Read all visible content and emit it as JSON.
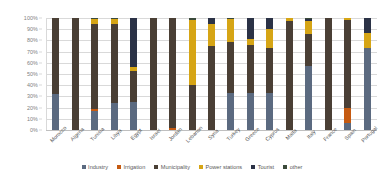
{
  "chart_data": {
    "type": "bar",
    "subtype": "stacked-percent",
    "title": "",
    "xlabel": "",
    "ylabel": "",
    "ylim": [
      0,
      100
    ],
    "ytick_labels": [
      "0%",
      "10%",
      "20%",
      "30%",
      "40%",
      "50%",
      "60%",
      "70%",
      "80%",
      "90%",
      "100%"
    ],
    "ytick_values": [
      0,
      10,
      20,
      30,
      40,
      50,
      60,
      70,
      80,
      90,
      100
    ],
    "grid": true,
    "legend_position": "bottom",
    "categories": [
      "Morocco",
      "Algeria",
      "Tunisia",
      "Libya",
      "Egypt",
      "Israel",
      "Jordan",
      "Lebanon",
      "Syria",
      "Turkey",
      "Greece",
      "Cyprus",
      "Malta",
      "Italy",
      "France",
      "Spain",
      "Portugal"
    ],
    "series": [
      {
        "name": "Industry",
        "color": "#5b6a80",
        "values": [
          32,
          0,
          17,
          24,
          25,
          0,
          0,
          0,
          0,
          33,
          33,
          33,
          0,
          57,
          0,
          6,
          73
        ]
      },
      {
        "name": "Irrigation",
        "color": "#c55a11",
        "values": [
          0,
          0,
          2,
          0,
          0,
          0,
          2,
          0,
          0,
          0,
          0,
          0,
          0,
          0,
          0,
          14,
          0
        ]
      },
      {
        "name": "Municipality",
        "color": "#4a3f35",
        "values": [
          68,
          100,
          76,
          71,
          28,
          100,
          98,
          40,
          75,
          46,
          43,
          40,
          97,
          29,
          100,
          78,
          0
        ]
      },
      {
        "name": "Power stations",
        "color": "#d6a515",
        "values": [
          0,
          0,
          4,
          4,
          3,
          0,
          0,
          58,
          20,
          20,
          5,
          17,
          3,
          11,
          0,
          2,
          14
        ]
      },
      {
        "name": "Tourist",
        "color": "#2b3246",
        "values": [
          0,
          0,
          0,
          0,
          44,
          0,
          0,
          0,
          5,
          0,
          19,
          10,
          0,
          2,
          0,
          0,
          13
        ]
      },
      {
        "name": "other",
        "color": "#3b4a3a",
        "values": [
          0,
          0,
          1,
          1,
          0,
          0,
          0,
          2,
          0,
          1,
          0,
          0,
          0,
          1,
          0,
          0,
          0
        ]
      }
    ]
  }
}
